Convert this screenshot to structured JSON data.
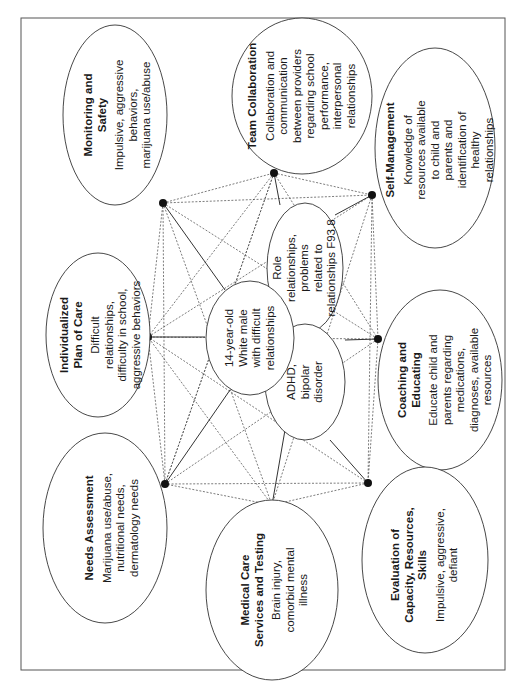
{
  "figure": {
    "orientation": "rotated -90 degrees",
    "center_nodes": [
      {
        "id": "patient",
        "text": "14-year-old White male with difficult relationships",
        "lines": [
          "14-year-old",
          "White male",
          "with difficult",
          "relationships"
        ]
      },
      {
        "id": "role",
        "text": "Role relationships, problems related to relationships F93.8",
        "lines": [
          "Role",
          "relationships,",
          "problems",
          "related to",
          "relationships F93.8"
        ]
      },
      {
        "id": "adhd",
        "text": "ADHD, bipolar disorder",
        "lines": [
          "ADHD,",
          "bipolar",
          "disorder"
        ]
      }
    ],
    "outer_nodes": [
      {
        "id": "monitoring",
        "title": "Monitoring and Safety",
        "title_lines": [
          "Monitoring and",
          "Safety"
        ],
        "desc_lines": [
          "Impulsive, aggressive",
          "behaviors,",
          "marijuana use/abuse"
        ]
      },
      {
        "id": "team",
        "title": "Team Collaboration",
        "title_lines": [
          "Team Collaboration"
        ],
        "desc_lines": [
          "Collaboration and",
          "communication",
          "between providers",
          "regarding school",
          "performance,",
          "interpersonal",
          "relationships"
        ]
      },
      {
        "id": "selfmgmt",
        "title": "Self-Management",
        "title_lines": [
          "Self-Management"
        ],
        "desc_lines": [
          "Knowledge of",
          "resources available",
          "to child and",
          "parents and",
          "identification of",
          "healthy",
          "relationships"
        ]
      },
      {
        "id": "coaching",
        "title": "Coaching and Educating",
        "title_lines": [
          "Coaching and",
          "Educating"
        ],
        "desc_lines": [
          "Educate child and",
          "parents regarding",
          "medications,",
          "diagnoses, available",
          "resources"
        ]
      },
      {
        "id": "evaluation",
        "title": "Evaluation of Capacity, Resources, Skills",
        "title_lines": [
          "Evaluation of",
          "Capacity, Resources,",
          "Skills"
        ],
        "desc_lines": [
          "Impulsive, aggressive,",
          "defiant"
        ]
      },
      {
        "id": "medical",
        "title": "Medical Care Services and Testing",
        "title_lines": [
          "Medical Care",
          "Services and Testing"
        ],
        "desc_lines": [
          "Brain injury,",
          "comorbid mental",
          "illness"
        ]
      },
      {
        "id": "needs",
        "title": "Needs Assessment",
        "title_lines": [
          "Needs Assessment"
        ],
        "desc_lines": [
          "Marijuana use/abuse,",
          "nutritional needs,",
          "dermatology needs"
        ]
      },
      {
        "id": "plan",
        "title": "Individualized Plan of Care",
        "title_lines": [
          "Individualized",
          "Plan of Care"
        ],
        "desc_lines": [
          "Difficult",
          "relationships,",
          "difficulty in school,",
          "aggressive behaviors"
        ]
      }
    ]
  }
}
